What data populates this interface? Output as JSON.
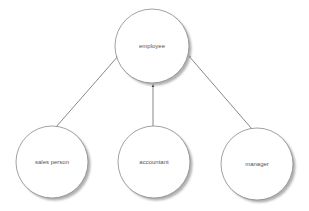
{
  "diagram": {
    "type": "inheritance",
    "colors": {
      "background": "#ffffff",
      "node_fill": "#ffffff",
      "node_stroke": "#8a8a8a",
      "shadow": "#b5b5b5",
      "edge": "#555555",
      "label": "#555555"
    },
    "nodes": [
      {
        "id": "employee",
        "label": "employee",
        "cx": 152,
        "cy": 46,
        "r": 37
      },
      {
        "id": "sales_person",
        "label": "sales person",
        "cx": 52,
        "cy": 162,
        "r": 36
      },
      {
        "id": "accountant",
        "label": "accountant",
        "cx": 154,
        "cy": 162,
        "r": 36
      },
      {
        "id": "manager",
        "label": "manager",
        "cx": 257,
        "cy": 164,
        "r": 36
      }
    ],
    "edges": [
      {
        "from": "sales_person",
        "to": "employee",
        "arrow": "filled-triangle",
        "x1": 56,
        "y1": 127,
        "x2": 119,
        "y2": 55
      },
      {
        "from": "accountant",
        "to": "employee",
        "arrow": "filled-triangle",
        "x1": 153,
        "y1": 126,
        "x2": 153,
        "y2": 84
      },
      {
        "from": "manager",
        "to": "employee",
        "arrow": "filled-triangle",
        "x1": 252,
        "y1": 129,
        "x2": 188,
        "y2": 55
      }
    ]
  }
}
